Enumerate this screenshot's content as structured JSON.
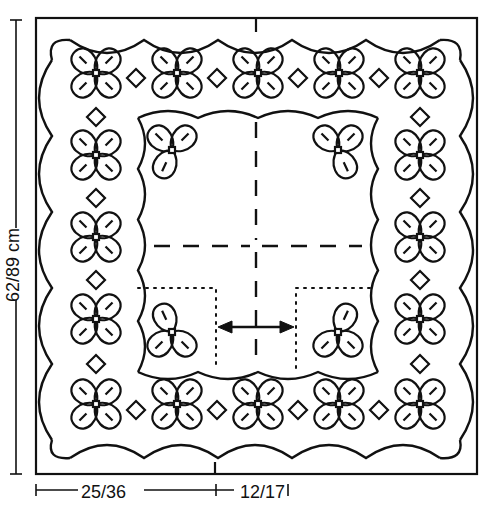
{
  "diagram": {
    "type": "tablecloth-pattern-schematic",
    "colors": {
      "line": "#111111",
      "background": "#ffffff"
    },
    "dimensions": {
      "height_label": "62/89 cm",
      "width_left_label": "25/36",
      "width_right_label": "12/17"
    },
    "motifs": {
      "four_leaf_flower_count": 16,
      "three_leaf_corner_count": 4,
      "diamond_count": 16
    },
    "markers": {
      "fold_lines": "dashed center cross",
      "double_arrow": "horizontal two-headed arrow between dotted inset lines"
    }
  }
}
